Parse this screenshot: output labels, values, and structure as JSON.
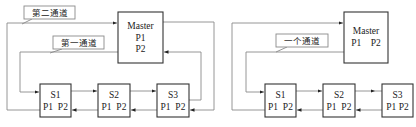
{
  "diagrams": [
    {
      "id": "two-channel",
      "labels": {
        "channel_2": "第二通道",
        "channel_1": "第一通道"
      },
      "master": {
        "title": "Master",
        "p1": "P1",
        "p2": "P2"
      },
      "slaves": [
        {
          "name": "S1",
          "ports": "P1  P2"
        },
        {
          "name": "S2",
          "ports": "P1  P2"
        },
        {
          "name": "S3",
          "ports": "P1  P2"
        }
      ]
    },
    {
      "id": "one-channel",
      "labels": {
        "channel": "一个通道"
      },
      "master": {
        "title": "Master",
        "ports": "P1    P2"
      },
      "slaves": [
        {
          "name": "S1",
          "ports": "P1  P2"
        },
        {
          "name": "S2",
          "ports": "P1  P2"
        },
        {
          "name": "S3",
          "ports": "P1 P2"
        }
      ]
    }
  ],
  "colors": {
    "box_stroke": "#333333",
    "line_stroke": "#8a8a8a",
    "background": "#ffffff"
  }
}
